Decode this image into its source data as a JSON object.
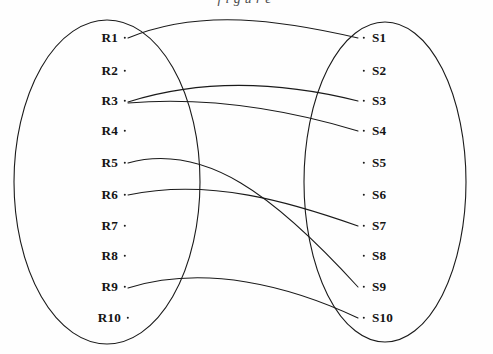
{
  "figure": {
    "type": "bipartite-mapping-diagram",
    "truncated_caption_above": "figure",
    "background_color": "#fefefe",
    "stroke_color": "#1a1a1a",
    "text_color": "#141414"
  },
  "left_set": {
    "name": "R",
    "ellipse": {
      "cx": 107,
      "cy": 182,
      "rx": 93,
      "ry": 162
    },
    "nodes": [
      {
        "label": "R1",
        "x": 118,
        "y": 38,
        "dot_x": 125,
        "dot_y": 38
      },
      {
        "label": "R2",
        "x": 118,
        "y": 71,
        "dot_x": 125,
        "dot_y": 71
      },
      {
        "label": "R3",
        "x": 118,
        "y": 101,
        "dot_x": 125,
        "dot_y": 101
      },
      {
        "label": "R4",
        "x": 118,
        "y": 131,
        "dot_x": 125,
        "dot_y": 131
      },
      {
        "label": "R5",
        "x": 118,
        "y": 163,
        "dot_x": 125,
        "dot_y": 163
      },
      {
        "label": "R6",
        "x": 118,
        "y": 195,
        "dot_x": 125,
        "dot_y": 195
      },
      {
        "label": "R7",
        "x": 118,
        "y": 226,
        "dot_x": 125,
        "dot_y": 226
      },
      {
        "label": "R8",
        "x": 118,
        "y": 256,
        "dot_x": 125,
        "dot_y": 256
      },
      {
        "label": "R9",
        "x": 118,
        "y": 287,
        "dot_x": 125,
        "dot_y": 287
      },
      {
        "label": "R10",
        "x": 121,
        "y": 318,
        "dot_x": 128,
        "dot_y": 318
      }
    ]
  },
  "right_set": {
    "name": "S",
    "ellipse": {
      "cx": 385,
      "cy": 182,
      "rx": 81,
      "ry": 160
    },
    "nodes": [
      {
        "label": "S1",
        "x": 372,
        "y": 38,
        "dot_x": 364,
        "dot_y": 38
      },
      {
        "label": "S2",
        "x": 372,
        "y": 71,
        "dot_x": 364,
        "dot_y": 71
      },
      {
        "label": "S3",
        "x": 372,
        "y": 101,
        "dot_x": 364,
        "dot_y": 101
      },
      {
        "label": "S4",
        "x": 372,
        "y": 131,
        "dot_x": 364,
        "dot_y": 131
      },
      {
        "label": "S5",
        "x": 372,
        "y": 163,
        "dot_x": 364,
        "dot_y": 163
      },
      {
        "label": "S6",
        "x": 372,
        "y": 195,
        "dot_x": 364,
        "dot_y": 195
      },
      {
        "label": "S7",
        "x": 372,
        "y": 226,
        "dot_x": 364,
        "dot_y": 226
      },
      {
        "label": "S8",
        "x": 372,
        "y": 256,
        "dot_x": 364,
        "dot_y": 256
      },
      {
        "label": "S9",
        "x": 372,
        "y": 287,
        "dot_x": 364,
        "dot_y": 287
      },
      {
        "label": "S10",
        "x": 372,
        "y": 318,
        "dot_x": 364,
        "dot_y": 318
      }
    ]
  },
  "edges": [
    {
      "from": "R1",
      "to": "S1",
      "path": "M 128 38 C 200 8 280 20 358 38"
    },
    {
      "from": "R3",
      "to": "S3",
      "path": "M 128 102 C 210 76 290 84 358 101"
    },
    {
      "from": "R3",
      "to": "S4",
      "path": "M 128 103 C 215 96 295 112 358 131"
    },
    {
      "from": "R6",
      "to": "S7",
      "path": "M 128 195 C 210 178 290 202 358 226"
    },
    {
      "from": "R5",
      "to": "S9",
      "path": "M 128 163 C 205 142 275 196 358 287"
    },
    {
      "from": "R9",
      "to": "S10",
      "path": "M 128 288 C 205 264 290 286 358 318"
    }
  ]
}
